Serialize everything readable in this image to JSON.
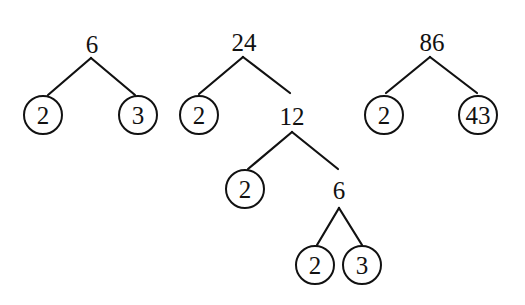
{
  "diagram": {
    "type": "factor-trees",
    "colors": {
      "stroke": "#111111",
      "text": "#111111",
      "background": "#ffffff"
    },
    "trees": [
      {
        "root": "6",
        "nodes": [
          {
            "id": "t1_root",
            "label": "6",
            "x": 92,
            "y": 45,
            "circled": false
          },
          {
            "id": "t1_a",
            "label": "2",
            "x": 43,
            "y": 115,
            "circled": true
          },
          {
            "id": "t1_b",
            "label": "3",
            "x": 138,
            "y": 115,
            "circled": true
          }
        ],
        "edges": [
          {
            "x1": 91,
            "y1": 58,
            "x2": 48,
            "y2": 95
          },
          {
            "x1": 91,
            "y1": 58,
            "x2": 135,
            "y2": 95
          }
        ]
      },
      {
        "root": "24",
        "nodes": [
          {
            "id": "t2_root",
            "label": "24",
            "x": 244,
            "y": 43,
            "circled": false
          },
          {
            "id": "t2_a",
            "label": "2",
            "x": 199,
            "y": 115,
            "circled": true
          },
          {
            "id": "t2_b",
            "label": "12",
            "x": 292,
            "y": 117,
            "circled": false
          },
          {
            "id": "t2_c",
            "label": "2",
            "x": 245,
            "y": 189,
            "circled": true
          },
          {
            "id": "t2_d",
            "label": "6",
            "x": 339,
            "y": 191,
            "circled": false
          },
          {
            "id": "t2_e",
            "label": "2",
            "x": 315,
            "y": 265,
            "circled": true
          },
          {
            "id": "t2_f",
            "label": "3",
            "x": 362,
            "y": 265,
            "circled": true
          }
        ],
        "edges": [
          {
            "x1": 243,
            "y1": 57,
            "x2": 199,
            "y2": 94
          },
          {
            "x1": 243,
            "y1": 57,
            "x2": 290,
            "y2": 93
          },
          {
            "x1": 292,
            "y1": 132,
            "x2": 248,
            "y2": 169
          },
          {
            "x1": 292,
            "y1": 132,
            "x2": 338,
            "y2": 169
          },
          {
            "x1": 339,
            "y1": 208,
            "x2": 317,
            "y2": 245
          },
          {
            "x1": 339,
            "y1": 208,
            "x2": 362,
            "y2": 245
          }
        ]
      },
      {
        "root": "86",
        "nodes": [
          {
            "id": "t3_root",
            "label": "86",
            "x": 432,
            "y": 43,
            "circled": false
          },
          {
            "id": "t3_a",
            "label": "2",
            "x": 384,
            "y": 115,
            "circled": true
          },
          {
            "id": "t3_b",
            "label": "43",
            "x": 478,
            "y": 115,
            "circled": true
          }
        ],
        "edges": [
          {
            "x1": 430,
            "y1": 57,
            "x2": 386,
            "y2": 93
          },
          {
            "x1": 430,
            "y1": 57,
            "x2": 477,
            "y2": 93
          }
        ]
      }
    ]
  }
}
